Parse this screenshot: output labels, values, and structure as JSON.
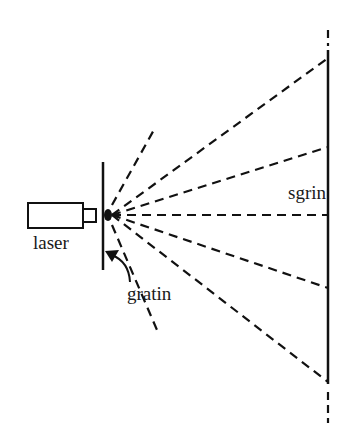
{
  "labels": {
    "laser": "laser",
    "screen": "sgrin",
    "grating": "gratin"
  },
  "colors": {
    "ink": "#111111",
    "background": "#ffffff"
  },
  "geometry": {
    "source": {
      "x": 107,
      "y": 215
    },
    "screen_x": 328,
    "ray_targets_y": [
      58,
      147,
      215,
      288,
      382
    ],
    "steep_rays": [
      {
        "x": 155,
        "y": 128
      },
      {
        "x": 157,
        "y": 330
      }
    ]
  }
}
